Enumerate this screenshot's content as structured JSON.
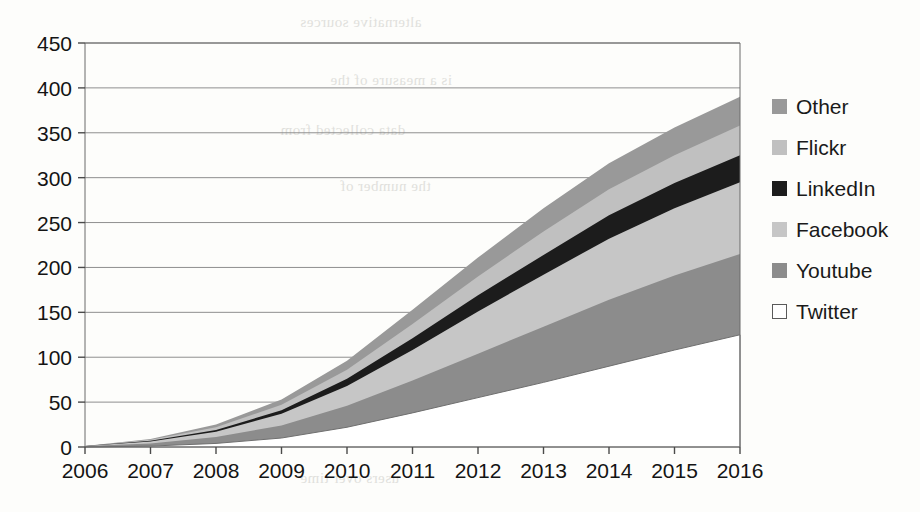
{
  "chart_data": {
    "type": "area",
    "title": "",
    "xlabel": "",
    "ylabel": "",
    "stacked": true,
    "grid": true,
    "legend_position": "right",
    "categories": [
      2006,
      2007,
      2008,
      2009,
      2010,
      2011,
      2012,
      2013,
      2014,
      2015,
      2016
    ],
    "x_tick_labels": [
      "2006",
      "2007",
      "2008",
      "2009",
      "2010",
      "2011",
      "2012",
      "2013",
      "2014",
      "2015",
      "2016"
    ],
    "y_tick_labels": [
      "0",
      "50",
      "100",
      "150",
      "200",
      "250",
      "300",
      "350",
      "400",
      "450"
    ],
    "ylim": [
      0,
      450
    ],
    "y_step": 50,
    "xlim": [
      2006,
      2016
    ],
    "series": [
      {
        "name": "Twitter",
        "color": "#ffffff",
        "swatch_outline": "#5a5a5a",
        "values": [
          0,
          1,
          4,
          10,
          22,
          38,
          55,
          72,
          90,
          108,
          125
        ]
      },
      {
        "name": "Youtube",
        "color": "#8c8c8c",
        "swatch_outline": "",
        "values": [
          1,
          3,
          7,
          14,
          24,
          36,
          49,
          62,
          74,
          83,
          90
        ]
      },
      {
        "name": "Facebook",
        "color": "#c6c6c6",
        "swatch_outline": "",
        "values": [
          0,
          2,
          6,
          13,
          22,
          34,
          47,
          58,
          68,
          75,
          80
        ]
      },
      {
        "name": "LinkedIn",
        "color": "#1c1c1c",
        "swatch_outline": "",
        "values": [
          0,
          1,
          2,
          4,
          8,
          13,
          18,
          22,
          26,
          28,
          30
        ]
      },
      {
        "name": "Flickr",
        "color": "#c0c0c0",
        "swatch_outline": "",
        "values": [
          0,
          1,
          3,
          6,
          10,
          16,
          21,
          26,
          29,
          31,
          33
        ]
      },
      {
        "name": "Other",
        "color": "#999999",
        "swatch_outline": "",
        "values": [
          0,
          1,
          3,
          6,
          10,
          16,
          21,
          26,
          29,
          31,
          32
        ]
      }
    ],
    "stack_totals": [
      1,
      9,
      25,
      53,
      96,
      153,
      211,
      266,
      316,
      356,
      390
    ],
    "legend_order_top_to_bottom": [
      "Other",
      "Flickr",
      "LinkedIn",
      "Facebook",
      "Youtube",
      "Twitter"
    ]
  },
  "legend": {
    "items": [
      {
        "label": "Other",
        "swatch": "#999999",
        "outline": false
      },
      {
        "label": "Flickr",
        "swatch": "#c0c0c0",
        "outline": false
      },
      {
        "label": "LinkedIn",
        "swatch": "#1c1c1c",
        "outline": false
      },
      {
        "label": "Facebook",
        "swatch": "#c6c6c6",
        "outline": false
      },
      {
        "label": "Youtube",
        "swatch": "#8c8c8c",
        "outline": false
      },
      {
        "label": "Twitter",
        "swatch": "#ffffff",
        "outline": true
      }
    ]
  },
  "axes": {
    "y_ticks": [
      "450",
      "400",
      "350",
      "300",
      "250",
      "200",
      "150",
      "100",
      "50",
      "0"
    ],
    "x_ticks": [
      "2006",
      "2007",
      "2008",
      "2009",
      "2010",
      "2011",
      "2012",
      "2013",
      "2014",
      "2015",
      "2016"
    ]
  },
  "scan_artifacts": {
    "show_bleed_through": true,
    "bleed_lines": [
      "alternative sources",
      "is a measure of the",
      "data collected from",
      "the number of",
      "users over time"
    ]
  }
}
